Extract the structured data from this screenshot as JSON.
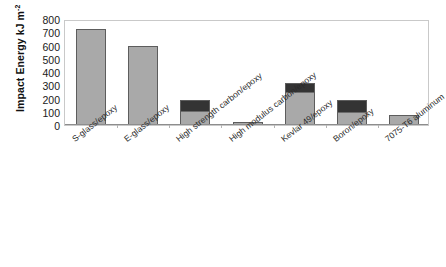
{
  "chart_data": {
    "type": "bar",
    "title": "",
    "subtitle": "",
    "xlabel": "",
    "ylabel": "Impact Energy kJ m",
    "ylabel_superscript": "-2",
    "ylim": [
      0,
      800
    ],
    "yticks": [
      800,
      700,
      600,
      500,
      400,
      300,
      200,
      100,
      0
    ],
    "ytick_labels": [
      "800",
      "700",
      "600",
      "500",
      "400",
      "300",
      "200",
      "100",
      "0"
    ],
    "grid": false,
    "legend": "none",
    "stacked": true,
    "categories": [
      "S-glass/epoxy",
      "E-glass/epoxy",
      "High strength carbon/epoxy",
      "High modulus carbon/epoxy",
      "Kevlar 49/epoxy",
      "Boron/epoxy",
      "7075-T6 aluminum"
    ],
    "values": [
      725,
      600,
      190,
      20,
      320,
      190,
      78
    ],
    "series": [
      {
        "name": "lower-segment",
        "color": "#a9a9a9",
        "values": [
          725,
          600,
          105,
          20,
          250,
          100,
          78
        ]
      },
      {
        "name": "upper-segment",
        "color": "#343434",
        "values": [
          0,
          0,
          85,
          0,
          70,
          90,
          0
        ]
      }
    ],
    "bar_edge_color": "#5d5d5d",
    "axis_color": "#8d8d8d",
    "frame_color": "#c9c9c9",
    "background_color": "#ffffff",
    "text_color": "#1a1a1a"
  }
}
